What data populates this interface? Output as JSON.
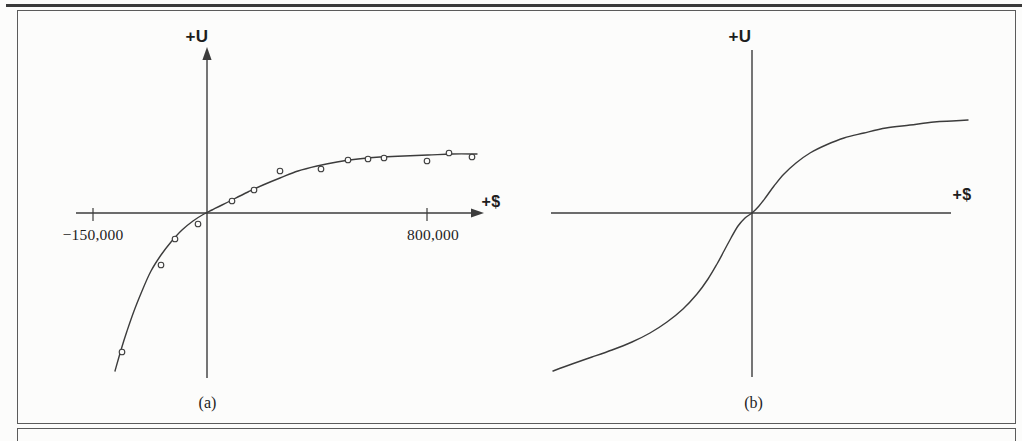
{
  "colors": {
    "ink": "#3c3c3c",
    "frame_border": "#5b5b5b",
    "top_rule": "#3a3a3a",
    "background": "#fcfcfb",
    "marker_fill": "#fcfcfb",
    "text": "#1e1e1e"
  },
  "chart_data": [
    {
      "panel": "a",
      "type": "scatter",
      "caption": "(a)",
      "xlabel": "+$",
      "ylabel": "+U",
      "x_ticks": [
        {
          "label": "−150,000",
          "value": -150000
        },
        {
          "label": "800,000",
          "value": 800000
        }
      ],
      "axes": "arrowheads on top of U-axis and right of $-axis; schematic scale (negative side stretched)",
      "curve_description": "concave increasing (risk-averse) utility curve fitted through empirical points",
      "utility_units": "arbitrary",
      "points_data_est": [
        [
          -112000,
          -140
        ],
        [
          -61000,
          -53
        ],
        [
          -42000,
          -27
        ],
        [
          -12000,
          -12
        ],
        [
          91000,
          11
        ],
        [
          171000,
          22
        ],
        [
          266000,
          41
        ],
        [
          415000,
          43
        ],
        [
          513000,
          52
        ],
        [
          586000,
          53
        ],
        [
          644000,
          54
        ],
        [
          800000,
          51
        ],
        [
          880000,
          59
        ],
        [
          964000,
          55
        ]
      ],
      "geometry": {
        "x_axis": {
          "x1": 76,
          "x2": 484,
          "y": 213,
          "arrow": true
        },
        "y_axis": {
          "x": 207,
          "y1": 47,
          "y2": 378,
          "arrow": true
        },
        "ticks": [
          {
            "x": 93,
            "y1": 208,
            "y2": 221
          },
          {
            "x": 427,
            "y1": 208,
            "y2": 221
          }
        ],
        "curve_px": [
          [
            115,
            371
          ],
          [
            121,
            350
          ],
          [
            127,
            331
          ],
          [
            134,
            311
          ],
          [
            142,
            291
          ],
          [
            151,
            271
          ],
          [
            161,
            255
          ],
          [
            171,
            242
          ],
          [
            182,
            230
          ],
          [
            193,
            221
          ],
          [
            204,
            214
          ],
          [
            212,
            210
          ],
          [
            222,
            205
          ],
          [
            234,
            199
          ],
          [
            248,
            192
          ],
          [
            263,
            185
          ],
          [
            280,
            178
          ],
          [
            298,
            171
          ],
          [
            317,
            166
          ],
          [
            337,
            162
          ],
          [
            358,
            159
          ],
          [
            380,
            157
          ],
          [
            404,
            156
          ],
          [
            428,
            155
          ],
          [
            452,
            154
          ],
          [
            477,
            154
          ]
        ],
        "points_px": [
          [
            122,
            352
          ],
          [
            161,
            265
          ],
          [
            175,
            239
          ],
          [
            198,
            224
          ],
          [
            232,
            201
          ],
          [
            254,
            190
          ],
          [
            280,
            171
          ],
          [
            321,
            169
          ],
          [
            348,
            160
          ],
          [
            368,
            159
          ],
          [
            384,
            158
          ],
          [
            427,
            161
          ],
          [
            449,
            153
          ],
          [
            472,
            157
          ]
        ]
      }
    },
    {
      "panel": "b",
      "type": "line",
      "caption": "(b)",
      "xlabel": "+$",
      "ylabel": "+U",
      "x_ticks": [],
      "axes": "plain axes without arrowheads or tick marks; unlabeled arbitrary units",
      "curve_description": "S-shaped utility curve: convex (risk-seeking) for losses, concave (risk-averse) for gains, steepest slope at the origin",
      "curve_samples_normalized": [
        [
          -1.0,
          -1.0
        ],
        [
          -0.7,
          -0.87
        ],
        [
          -0.43,
          -0.69
        ],
        [
          -0.22,
          -0.42
        ],
        [
          -0.11,
          -0.16
        ],
        [
          0,
          0
        ],
        [
          0.11,
          0.17
        ],
        [
          0.22,
          0.32
        ],
        [
          0.46,
          0.47
        ],
        [
          0.67,
          0.54
        ],
        [
          0.91,
          0.58
        ],
        [
          1.08,
          0.59
        ]
      ],
      "geometry": {
        "x_axis": {
          "x1": 551,
          "x2": 951,
          "y": 213,
          "arrow": false
        },
        "y_axis": {
          "x": 752,
          "y1": 50,
          "y2": 377,
          "arrow": false
        },
        "ticks": [],
        "curve_px": [
          [
            553,
            371
          ],
          [
            572,
            364
          ],
          [
            592,
            357
          ],
          [
            612,
            350
          ],
          [
            632,
            342
          ],
          [
            650,
            333
          ],
          [
            667,
            322
          ],
          [
            683,
            309
          ],
          [
            697,
            294
          ],
          [
            708,
            279
          ],
          [
            717,
            264
          ],
          [
            724,
            251
          ],
          [
            731,
            238
          ],
          [
            738,
            226
          ],
          [
            745,
            218
          ],
          [
            752,
            213
          ],
          [
            759,
            206
          ],
          [
            766,
            197
          ],
          [
            774,
            186
          ],
          [
            784,
            174
          ],
          [
            796,
            163
          ],
          [
            810,
            153
          ],
          [
            826,
            145
          ],
          [
            844,
            138
          ],
          [
            864,
            133
          ],
          [
            886,
            128
          ],
          [
            910,
            125
          ],
          [
            934,
            122
          ],
          [
            952,
            121
          ],
          [
            968,
            120
          ]
        ],
        "points_px": []
      }
    }
  ]
}
